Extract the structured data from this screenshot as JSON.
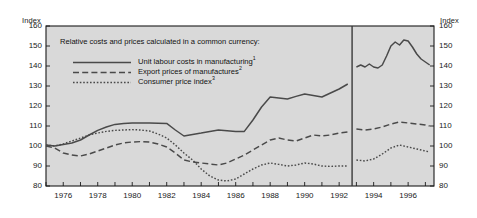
{
  "axis_titles": {
    "left": "Index",
    "right": "Index"
  },
  "legend": {
    "title": "Relative costs and prices calculated in a common currency:",
    "items": [
      {
        "label": "Unit labour costs in manufacturing",
        "note": "1",
        "style": "solid"
      },
      {
        "label": "Export prices of manufactures",
        "note": "2",
        "style": "dashed"
      },
      {
        "label": "Consumer price index",
        "note": "3",
        "style": "dotted"
      }
    ]
  },
  "colors": {
    "plot_background": "#d9d9d9",
    "line": "#4a4a4a",
    "axis": "#1a1a1a",
    "break_line": "#3a3a3a"
  },
  "chart_data": {
    "type": "line",
    "title": "",
    "xlabel": "",
    "ylabel": "Index",
    "xlim": [
      1975.0,
      1997.5
    ],
    "ylim": [
      80,
      160
    ],
    "yticks": [
      80,
      90,
      100,
      110,
      120,
      130,
      140,
      150,
      160
    ],
    "xticks": [
      1975,
      1976,
      1977,
      1978,
      1979,
      1980,
      1981,
      1982,
      1983,
      1984,
      1985,
      1986,
      1987,
      1988,
      1989,
      1990,
      1991,
      1992,
      1993,
      1994,
      1995,
      1996,
      1997
    ],
    "xtick_labels": [
      "",
      "1976",
      "",
      "1978",
      "",
      "1980",
      "",
      "1982",
      "",
      "1984",
      "",
      "1986",
      "",
      "1988",
      "",
      "1990",
      "",
      "1992",
      "",
      "1994",
      "",
      "1996",
      ""
    ],
    "grid": false,
    "legend_position": "upper-left-inside",
    "annotations": [
      {
        "type": "vertical-break-line",
        "x": 1992.75,
        "label": ""
      }
    ],
    "series": [
      {
        "name": "Unit labour costs in manufacturing",
        "style": "solid",
        "x": [
          1975.0,
          1975.5,
          1976.0,
          1976.5,
          1977.0,
          1977.5,
          1978.0,
          1978.5,
          1979.0,
          1979.5,
          1980.0,
          1980.5,
          1981.0,
          1981.5,
          1982.0,
          1982.5,
          1983.0,
          1983.5,
          1984.0,
          1984.5,
          1985.0,
          1985.5,
          1986.0,
          1986.5,
          1987.0,
          1987.5,
          1988.0,
          1988.5,
          1989.0,
          1989.5,
          1990.0,
          1990.5,
          1991.0,
          1991.5,
          1992.0,
          1992.5
        ],
        "values": [
          100.5,
          100.0,
          100.8,
          101.5,
          103.0,
          105.5,
          107.8,
          109.5,
          110.8,
          111.3,
          111.5,
          111.5,
          111.5,
          111.4,
          111.3,
          108.0,
          105.0,
          105.8,
          106.5,
          107.3,
          108.0,
          107.6,
          107.2,
          107.3,
          113.0,
          119.5,
          124.5,
          124.0,
          123.5,
          124.8,
          126.0,
          125.3,
          124.5,
          126.5,
          128.5,
          131.0
        ]
      },
      {
        "name": "Unit labour costs in manufacturing (post-break)",
        "style": "solid",
        "x": [
          1993.0,
          1993.25,
          1993.5,
          1993.75,
          1994.0,
          1994.25,
          1994.5,
          1994.75,
          1995.0,
          1995.25,
          1995.5,
          1995.75,
          1996.0,
          1996.25,
          1996.5,
          1996.75,
          1997.0,
          1997.25
        ],
        "values": [
          139.5,
          140.5,
          139.5,
          141.0,
          139.5,
          139.0,
          140.5,
          145.0,
          150.0,
          152.0,
          150.5,
          153.0,
          152.5,
          149.5,
          146.0,
          143.5,
          142.0,
          140.5
        ]
      },
      {
        "name": "Export prices of manufactures",
        "style": "dashed",
        "x": [
          1975.0,
          1975.5,
          1976.0,
          1976.5,
          1977.0,
          1977.5,
          1978.0,
          1978.5,
          1979.0,
          1979.5,
          1980.0,
          1980.5,
          1981.0,
          1981.5,
          1982.0,
          1982.5,
          1983.0,
          1983.5,
          1984.0,
          1984.5,
          1985.0,
          1985.5,
          1986.0,
          1986.5,
          1987.0,
          1987.5,
          1988.0,
          1988.5,
          1989.0,
          1989.5,
          1990.0,
          1990.5,
          1991.0,
          1991.5,
          1992.0,
          1992.5
        ],
        "values": [
          100.0,
          99.0,
          96.5,
          95.5,
          95.0,
          96.0,
          97.5,
          99.0,
          100.5,
          101.5,
          102.0,
          102.2,
          102.0,
          101.0,
          99.5,
          96.5,
          93.0,
          92.0,
          91.5,
          91.0,
          90.5,
          91.5,
          93.5,
          95.5,
          98.0,
          100.5,
          103.0,
          104.0,
          103.0,
          102.5,
          104.0,
          105.5,
          105.0,
          105.5,
          106.5,
          107.0
        ]
      },
      {
        "name": "Export prices of manufactures (post-break)",
        "style": "dashed",
        "x": [
          1993.0,
          1993.5,
          1994.0,
          1994.5,
          1995.0,
          1995.5,
          1996.0,
          1996.5,
          1997.0,
          1997.25
        ],
        "values": [
          108.5,
          108.0,
          108.5,
          109.5,
          111.0,
          112.0,
          111.5,
          111.0,
          110.5,
          110.0
        ]
      },
      {
        "name": "Consumer price index",
        "style": "dotted",
        "x": [
          1975.0,
          1975.5,
          1976.0,
          1976.5,
          1977.0,
          1977.5,
          1978.0,
          1978.5,
          1979.0,
          1979.5,
          1980.0,
          1980.5,
          1981.0,
          1981.5,
          1982.0,
          1982.5,
          1983.0,
          1983.5,
          1984.0,
          1984.5,
          1985.0,
          1985.5,
          1986.0,
          1986.5,
          1987.0,
          1987.5,
          1988.0,
          1988.5,
          1989.0,
          1989.5,
          1990.0,
          1990.5,
          1991.0,
          1991.5,
          1992.0,
          1992.5
        ],
        "values": [
          100.5,
          100.0,
          101.0,
          102.5,
          104.0,
          105.5,
          106.5,
          107.3,
          107.8,
          108.0,
          108.2,
          108.0,
          107.5,
          106.0,
          104.0,
          100.5,
          96.5,
          93.0,
          88.5,
          85.0,
          83.0,
          82.5,
          83.5,
          86.0,
          88.5,
          90.5,
          91.5,
          90.8,
          90.0,
          90.5,
          91.5,
          91.0,
          90.0,
          89.8,
          90.0,
          90.0
        ]
      },
      {
        "name": "Consumer price index (post-break)",
        "style": "dotted",
        "x": [
          1993.0,
          1993.5,
          1994.0,
          1994.5,
          1995.0,
          1995.5,
          1996.0,
          1996.5,
          1997.0,
          1997.25
        ],
        "values": [
          93.0,
          92.5,
          93.5,
          96.0,
          99.0,
          100.5,
          99.5,
          98.5,
          97.5,
          97.0
        ]
      }
    ]
  }
}
